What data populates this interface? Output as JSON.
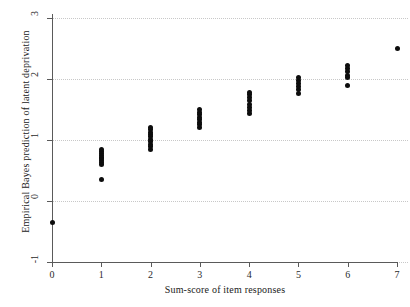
{
  "chart_data": {
    "type": "scatter",
    "title": "",
    "xlabel": "Sum-score of item responses",
    "ylabel": "Empirical Bayes prediction of latent deprivation",
    "xlim": [
      -0.25,
      7.25
    ],
    "ylim": [
      -1,
      3
    ],
    "xticks": [
      0,
      1,
      2,
      3,
      4,
      5,
      6,
      7
    ],
    "xtick_labels": [
      "0",
      "1",
      "2",
      "3",
      "4",
      "5",
      "6",
      "7"
    ],
    "yticks": [
      -1,
      0,
      1,
      2,
      3
    ],
    "ytick_labels": [
      "-1",
      "0",
      "1",
      "2",
      "3"
    ],
    "grid": "horizontal-dotted",
    "legend": "none",
    "marker": "filled-circle",
    "marker_color": "#0d0d0d",
    "series": [
      {
        "name": "Empirical Bayes predictions",
        "points": [
          {
            "x": 0,
            "y": -0.35
          },
          {
            "x": 1,
            "y": 0.35
          },
          {
            "x": 1,
            "y": 0.6
          },
          {
            "x": 1,
            "y": 0.63
          },
          {
            "x": 1,
            "y": 0.66
          },
          {
            "x": 1,
            "y": 0.69
          },
          {
            "x": 1,
            "y": 0.72
          },
          {
            "x": 1,
            "y": 0.75
          },
          {
            "x": 1,
            "y": 0.78
          },
          {
            "x": 1,
            "y": 0.81
          },
          {
            "x": 1,
            "y": 0.84
          },
          {
            "x": 2,
            "y": 0.85
          },
          {
            "x": 2,
            "y": 0.89
          },
          {
            "x": 2,
            "y": 0.93
          },
          {
            "x": 2,
            "y": 0.97
          },
          {
            "x": 2,
            "y": 1.01
          },
          {
            "x": 2,
            "y": 1.05
          },
          {
            "x": 2,
            "y": 1.09
          },
          {
            "x": 2,
            "y": 1.13
          },
          {
            "x": 2,
            "y": 1.17
          },
          {
            "x": 2,
            "y": 1.21
          },
          {
            "x": 3,
            "y": 1.21
          },
          {
            "x": 3,
            "y": 1.25
          },
          {
            "x": 3,
            "y": 1.29
          },
          {
            "x": 3,
            "y": 1.33
          },
          {
            "x": 3,
            "y": 1.37
          },
          {
            "x": 3,
            "y": 1.41
          },
          {
            "x": 3,
            "y": 1.45
          },
          {
            "x": 3,
            "y": 1.5
          },
          {
            "x": 4,
            "y": 1.44
          },
          {
            "x": 4,
            "y": 1.49
          },
          {
            "x": 4,
            "y": 1.54
          },
          {
            "x": 4,
            "y": 1.59
          },
          {
            "x": 4,
            "y": 1.64
          },
          {
            "x": 4,
            "y": 1.69
          },
          {
            "x": 4,
            "y": 1.74
          },
          {
            "x": 4,
            "y": 1.78
          },
          {
            "x": 5,
            "y": 1.77
          },
          {
            "x": 5,
            "y": 1.82
          },
          {
            "x": 5,
            "y": 1.87
          },
          {
            "x": 5,
            "y": 1.92
          },
          {
            "x": 5,
            "y": 1.97
          },
          {
            "x": 5,
            "y": 2.03
          },
          {
            "x": 6,
            "y": 1.89
          },
          {
            "x": 6,
            "y": 2.02
          },
          {
            "x": 6,
            "y": 2.06
          },
          {
            "x": 6,
            "y": 2.13
          },
          {
            "x": 6,
            "y": 2.17
          },
          {
            "x": 6,
            "y": 2.22
          },
          {
            "x": 7,
            "y": 2.5
          }
        ]
      }
    ]
  }
}
